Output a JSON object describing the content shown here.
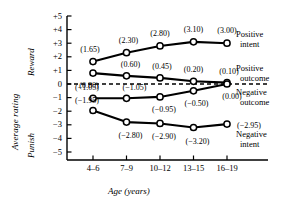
{
  "chart_data": {
    "type": "line",
    "title": "",
    "xlabel": "Age (years)",
    "ylabel": "Average rating",
    "ylabel_upper": "Reward",
    "ylabel_lower": "Punish",
    "categories": [
      "4–6",
      "7–9",
      "10–12",
      "13–15",
      "16–19"
    ],
    "ylim": [
      -5,
      5
    ],
    "yticks": [
      "+5",
      "+4",
      "+3",
      "+2",
      "+1",
      "0",
      "−1",
      "−2",
      "−3",
      "−4",
      "−5"
    ],
    "ytick_values": [
      5,
      4,
      3,
      2,
      1,
      0,
      -1,
      -2,
      -3,
      -4,
      -5
    ],
    "grid": false,
    "zero_line": true,
    "zero_line_style": "dashed",
    "legend_position": "right-inline",
    "series": [
      {
        "name": "Positive intent",
        "label_line1": "Positive",
        "label_line2": "intent",
        "values": [
          1.65,
          2.3,
          2.8,
          3.1,
          3.0
        ],
        "value_labels": [
          "(1.65)",
          "(2.30)",
          "(2.80)",
          "(3.10)",
          "(3.00)"
        ]
      },
      {
        "name": "Positive outcome",
        "label_line1": "Positive",
        "label_line2": "outcome",
        "values": [
          0.8,
          0.6,
          0.45,
          0.2,
          0.1
        ],
        "value_labels": [
          "(0.80)",
          "(0.60)",
          "(0.45)",
          "(0.20)",
          "(0.10)"
        ]
      },
      {
        "name": "Negative outcome",
        "label_line1": "Negative",
        "label_line2": "outcome",
        "values": [
          -1.05,
          -1.05,
          -0.95,
          -0.5,
          0.0
        ],
        "value_labels": [
          "(−1.05)",
          "(−1.05)",
          "(−0.95)",
          "(−0.50)",
          "(0.00)"
        ]
      },
      {
        "name": "Negative intent",
        "label_line1": "Negative",
        "label_line2": "intent",
        "values": [
          -1.95,
          -2.8,
          -2.9,
          -3.2,
          -2.95
        ],
        "value_labels": [
          "(−1.95)",
          "(−2.80)",
          "(−2.90)",
          "(−3.20)",
          "(−2.95)"
        ]
      }
    ],
    "colors": {
      "line": "#000000",
      "marker_fill": "#ffffff",
      "marker_stroke": "#000000",
      "axis": "#000000",
      "background": "#ffffff"
    }
  }
}
